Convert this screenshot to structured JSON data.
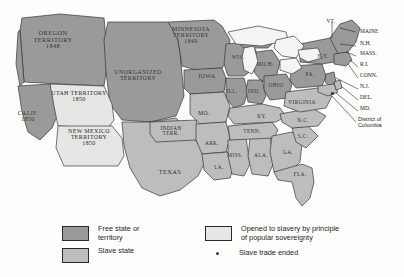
{
  "map": {
    "title_alt": "United States, 1850 — slave and free states and territories",
    "colors": {
      "free": "#9a9a9a",
      "slave": "#bdbdbd",
      "popular_sovereignty": "#e6e6e4",
      "water": "#f4f4f2",
      "outline": "#2b2b2b",
      "background": "#fdfdfb",
      "text": "#1b1b1b",
      "dot": "#3a3a3a"
    },
    "regions": [
      {
        "name": "oregon-territory",
        "label": "OREGON\nTERRITORY\n1848",
        "status": "free",
        "x": 52,
        "y": 33,
        "size": "big"
      },
      {
        "name": "minnesota-territory",
        "label": "MINNESOTA\nTERRITORY\n1849",
        "status": "free",
        "x": 190,
        "y": 29,
        "size": "med"
      },
      {
        "name": "unorganized-territory",
        "label": "UNORGANIZED\nTERRITORY",
        "status": "free",
        "x": 137,
        "y": 72,
        "size": "med"
      },
      {
        "name": "utah-territory",
        "label": "UTAH TERRITORY\n1850",
        "status": "popular_sovereignty",
        "x": 77,
        "y": 93,
        "size": "med"
      },
      {
        "name": "new-mexico-territory",
        "label": "NEW MEXICO\nTERRITORY\n1850",
        "status": "popular_sovereignty",
        "x": 88,
        "y": 131,
        "size": "med"
      },
      {
        "name": "california",
        "label": "CALIF.\n1850",
        "status": "free",
        "x": 27,
        "y": 113,
        "size": "med"
      },
      {
        "name": "indian-territory",
        "label": "INDIAN\nTERR.",
        "status": "slave",
        "x": 170,
        "y": 129,
        "size": "sm"
      },
      {
        "name": "texas",
        "label": "TEXAS",
        "status": "slave",
        "x": 170,
        "y": 172,
        "size": "big"
      },
      {
        "name": "iowa",
        "label": "IOWA",
        "status": "free",
        "x": 207,
        "y": 76,
        "size": "med"
      },
      {
        "name": "wisconsin",
        "label": "WIS.",
        "status": "free",
        "x": 238,
        "y": 58,
        "size": "sm"
      },
      {
        "name": "michigan",
        "label": "MICH.",
        "status": "free",
        "x": 265,
        "y": 65,
        "size": "sm"
      },
      {
        "name": "illinois",
        "label": "ILL.",
        "status": "free",
        "x": 232,
        "y": 92,
        "size": "sm"
      },
      {
        "name": "indiana",
        "label": "IND.",
        "status": "free",
        "x": 254,
        "y": 92,
        "size": "sm"
      },
      {
        "name": "ohio",
        "label": "OHIO",
        "status": "free",
        "x": 276,
        "y": 86,
        "size": "sm"
      },
      {
        "name": "missouri",
        "label": "MO.",
        "status": "slave",
        "x": 204,
        "y": 113,
        "size": "med"
      },
      {
        "name": "kentucky",
        "label": "KY.",
        "status": "slave",
        "x": 262,
        "y": 117,
        "size": "sm"
      },
      {
        "name": "tennessee",
        "label": "TENN.",
        "status": "slave",
        "x": 252,
        "y": 132,
        "size": "sm"
      },
      {
        "name": "arkansas",
        "label": "ARK.",
        "status": "slave",
        "x": 212,
        "y": 144,
        "size": "sm"
      },
      {
        "name": "mississippi",
        "label": "MISS.",
        "status": "slave",
        "x": 235,
        "y": 156,
        "size": "sm"
      },
      {
        "name": "alabama",
        "label": "ALA.",
        "status": "slave",
        "x": 261,
        "y": 156,
        "size": "sm"
      },
      {
        "name": "georgia",
        "label": "GA.",
        "status": "slave",
        "x": 288,
        "y": 153,
        "size": "sm"
      },
      {
        "name": "louisiana",
        "label": "LA.",
        "status": "slave",
        "x": 219,
        "y": 168,
        "size": "sm"
      },
      {
        "name": "florida",
        "label": "FLA.",
        "status": "slave",
        "x": 300,
        "y": 175,
        "size": "sm"
      },
      {
        "name": "south-carolina",
        "label": "S.C.",
        "status": "slave",
        "x": 303,
        "y": 137,
        "size": "sm"
      },
      {
        "name": "north-carolina",
        "label": "N.C.",
        "status": "slave",
        "x": 303,
        "y": 121,
        "size": "sm"
      },
      {
        "name": "virginia",
        "label": "VIRGINIA",
        "status": "slave",
        "x": 301,
        "y": 103,
        "size": "sm"
      },
      {
        "name": "pennsylvania",
        "label": "PA.",
        "status": "free",
        "x": 310,
        "y": 75,
        "size": "sm"
      },
      {
        "name": "new-york",
        "label": "N.Y.",
        "status": "free",
        "x": 322,
        "y": 57,
        "size": "sm"
      }
    ],
    "callouts": [
      {
        "name": "vermont",
        "label": "VT.",
        "x": 331,
        "y": 22
      },
      {
        "name": "maine",
        "label": "MAINE",
        "x": 367,
        "y": 32
      },
      {
        "name": "new-hampshire",
        "label": "N.H.",
        "x": 369,
        "y": 44
      },
      {
        "name": "massachusetts",
        "label": "MASS.",
        "x": 369,
        "y": 54
      },
      {
        "name": "rhode-island",
        "label": "R.I.",
        "x": 371,
        "y": 65
      },
      {
        "name": "connecticut",
        "label": "CONN.",
        "x": 369,
        "y": 76
      },
      {
        "name": "new-jersey",
        "label": "N.J.",
        "x": 369,
        "y": 87
      },
      {
        "name": "delaware",
        "label": "DEL.",
        "x": 369,
        "y": 98
      },
      {
        "name": "maryland",
        "label": "MD.",
        "x": 369,
        "y": 109
      },
      {
        "name": "district-of-columbia",
        "label": "District of\nColumbia",
        "x": 357,
        "y": 120
      }
    ],
    "slave_trade_dot": {
      "name": "slave-trade-ended-dot",
      "x": 332,
      "y": 93
    }
  },
  "legend": {
    "items": [
      {
        "name": "legend-free-state",
        "swatch": "free",
        "text": "Free state or\nterritory",
        "x": 62,
        "y": 225
      },
      {
        "name": "legend-slave-state",
        "swatch": "slave",
        "text": "Slave state",
        "x": 62,
        "y": 247
      },
      {
        "name": "legend-popular-sovereignty",
        "swatch": "popular_sovereignty",
        "text": "Opened to slavery by principle\nof popular sovereignty",
        "x": 205,
        "y": 225
      },
      {
        "name": "legend-slave-trade-ended",
        "swatch": "dot",
        "text": "Slave trade ended",
        "x": 205,
        "y": 247
      }
    ]
  }
}
